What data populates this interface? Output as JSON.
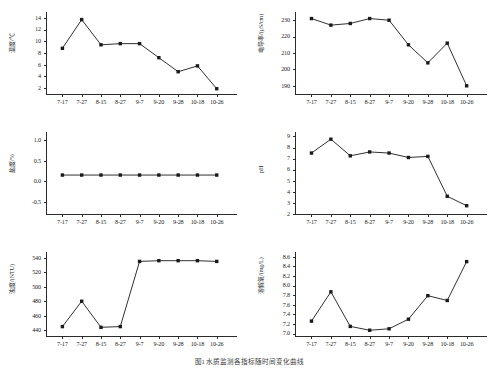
{
  "figure": {
    "caption": "图1 水质监测各指标随时间变化曲线",
    "categories": [
      "7-17",
      "7-27",
      "8-15",
      "8-27",
      "9-7",
      "9-20",
      "9-28",
      "10-18",
      "10-26"
    ],
    "marker_color": "#1a1a1a",
    "line_color": "#1a1a1a",
    "axis_color": "#2b2b2b"
  },
  "chart_data": [
    {
      "type": "line",
      "id": "temperature",
      "title": "",
      "xlabel": "",
      "ylabel": "温度/℃",
      "categories": [
        "7-17",
        "7-27",
        "8-15",
        "8-27",
        "9-7",
        "9-20",
        "9-28",
        "10-18",
        "10-26"
      ],
      "values": [
        8.8,
        13.7,
        9.4,
        9.6,
        9.6,
        7.2,
        4.8,
        5.8,
        1.9
      ],
      "ylim": [
        1,
        15
      ],
      "yticks": [
        2,
        4,
        6,
        8,
        10,
        12,
        14
      ],
      "grid": false,
      "legend": "none"
    },
    {
      "type": "line",
      "id": "conductivity",
      "title": "",
      "xlabel": "",
      "ylabel": "电导率/(μS/cm)",
      "categories": [
        "7-17",
        "7-27",
        "8-15",
        "8-27",
        "9-7",
        "9-20",
        "9-28",
        "10-18",
        "10-26"
      ],
      "values": [
        231,
        227,
        228,
        231,
        230,
        215,
        204,
        216,
        190
      ],
      "ylim": [
        185,
        235
      ],
      "yticks": [
        190,
        200,
        210,
        220,
        230
      ],
      "grid": false,
      "legend": "none"
    },
    {
      "type": "line",
      "id": "salinity",
      "title": "",
      "xlabel": "",
      "ylabel": "盐度/%",
      "categories": [
        "7-17",
        "7-27",
        "8-15",
        "8-27",
        "9-7",
        "9-20",
        "9-28",
        "10-18",
        "10-26"
      ],
      "values": [
        0.15,
        0.15,
        0.15,
        0.15,
        0.15,
        0.15,
        0.15,
        0.15,
        0.15
      ],
      "ylim": [
        -0.8,
        1.2
      ],
      "yticks": [
        -0.5,
        0.0,
        0.5,
        1.0
      ],
      "ytick_labels": [
        "-0.5",
        "0.0",
        "0.5",
        "1.0"
      ],
      "grid": false,
      "legend": "none"
    },
    {
      "type": "line",
      "id": "ph",
      "title": "",
      "xlabel": "",
      "ylabel": "pH",
      "categories": [
        "7-17",
        "7-27",
        "8-15",
        "8-27",
        "9-7",
        "9-20",
        "9-28",
        "10-18",
        "10-26"
      ],
      "values": [
        7.5,
        8.75,
        7.25,
        7.6,
        7.5,
        7.1,
        7.2,
        3.6,
        2.75
      ],
      "ylim": [
        2,
        9.4
      ],
      "yticks": [
        2,
        3,
        4,
        5,
        6,
        7,
        8,
        9
      ],
      "grid": false,
      "legend": "none"
    },
    {
      "type": "line",
      "id": "turbidity",
      "title": "",
      "xlabel": "",
      "ylabel": "浊度/(NTU)",
      "categories": [
        "7-17",
        "7-27",
        "8-15",
        "8-27",
        "9-7",
        "9-20",
        "9-28",
        "10-18",
        "10-26"
      ],
      "values": [
        445,
        480,
        444,
        445,
        535,
        536,
        536,
        536,
        535
      ],
      "ylim": [
        432,
        548
      ],
      "yticks": [
        440,
        460,
        480,
        500,
        520,
        540
      ],
      "grid": false,
      "legend": "none"
    },
    {
      "type": "line",
      "id": "dissolved-oxygen",
      "title": "",
      "xlabel": "",
      "ylabel": "溶解氧/(mg/L)",
      "categories": [
        "7-17",
        "7-27",
        "8-15",
        "8-27",
        "9-7",
        "9-20",
        "9-28",
        "10-18",
        "10-26"
      ],
      "values": [
        7.26,
        7.87,
        7.15,
        7.07,
        7.1,
        7.3,
        7.79,
        7.69,
        8.5
      ],
      "ylim": [
        6.95,
        8.7
      ],
      "yticks": [
        7.0,
        7.2,
        7.4,
        7.6,
        7.8,
        8.0,
        8.2,
        8.4,
        8.6
      ],
      "ytick_labels": [
        "7.0",
        "7.2",
        "7.4",
        "7.6",
        "7.8",
        "8.0",
        "8.2",
        "8.4",
        "8.6"
      ],
      "grid": false,
      "legend": "none"
    }
  ]
}
